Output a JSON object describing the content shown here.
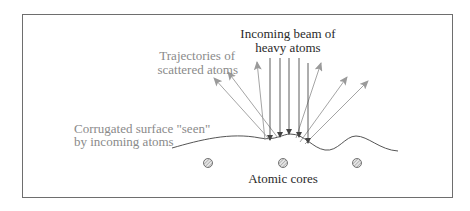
{
  "diagram": {
    "labels": {
      "beam_line1": "Incoming beam of",
      "beam_line2": "heavy atoms",
      "traj_line1": "Trajectories of",
      "traj_line2": "scattered atoms",
      "surf_line1": "Corrugated surface \"seen\"",
      "surf_line2": "by incoming atoms",
      "cores": "Atomic cores"
    },
    "colors": {
      "frame": "#6e6e6e",
      "beam": "#4a4a4a",
      "scattered": "#9a9a9a",
      "surface": "#555555",
      "gray_text": "#8a8a8a",
      "dark_text": "#2a2a2a"
    },
    "atomic_cores_count": 3,
    "incoming_beam_count": 5,
    "scattered_trajectories_count": 6
  }
}
